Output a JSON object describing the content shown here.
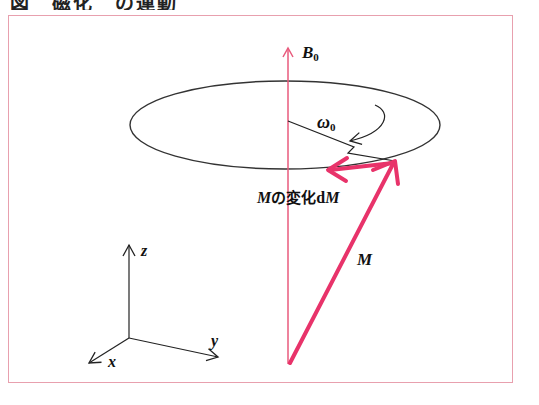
{
  "header": {
    "title": "図　磁化　の運動"
  },
  "diagram": {
    "labels": {
      "field": "B",
      "field_sub": "0",
      "omega": "ω",
      "omega_sub": "0",
      "magnetization": "M",
      "change_prefix": "M",
      "change_text": "の変化",
      "change_d": "d",
      "change_suffix": "M",
      "axis_x": "x",
      "axis_y": "y",
      "axis_z": "z"
    },
    "colors": {
      "vector": "#e8336a",
      "field_axis": "#e85a7c",
      "line": "#333333",
      "frame": "#e8a0ae"
    }
  }
}
